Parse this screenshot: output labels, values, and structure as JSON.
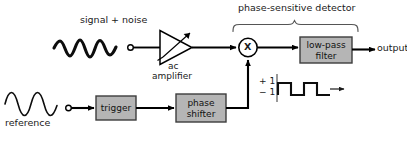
{
  "figure": {
    "type": "block-diagram",
    "background_color": "#ffffff",
    "line_color": "#000000",
    "block_fill_color": "#b5b5b5",
    "block_stroke_color": "#3d3d3d"
  },
  "labels": {
    "signal_plus_noise": "signal  +  noise",
    "ac_amplifier_line1": "ac",
    "ac_amplifier_line2": "amplifier",
    "phase_sensitive_detector": "phase-sensitive detector",
    "output": "output",
    "reference": "reference",
    "plus_one": "+ 1",
    "minus_one": "− 1",
    "mixer_symbol": "X"
  },
  "blocks": [
    {
      "id": "low-pass-filter",
      "line1": "low-pass",
      "line2": "filter",
      "x": 300,
      "y": 37,
      "w": 52,
      "h": 26
    },
    {
      "id": "trigger",
      "line1": "trigger",
      "line2": "",
      "x": 96,
      "y": 96,
      "w": 40,
      "h": 24
    },
    {
      "id": "phase-shifter",
      "line1": "phase",
      "line2": "shifter",
      "x": 176,
      "y": 94,
      "w": 50,
      "h": 28
    }
  ],
  "waveforms": {
    "signal_noise": {
      "style": "thick-noisy-sine",
      "cycles": 2.5,
      "x": 54,
      "y": 48,
      "w": 62,
      "amplitude": 10
    },
    "reference": {
      "style": "thin-sine",
      "cycles": 2.5,
      "x": 5,
      "y": 104,
      "w": 54,
      "amplitude": 11
    },
    "square_wave": {
      "style": "square",
      "cycles": 2,
      "x": 278,
      "y_high": 83,
      "y_low": 95,
      "w": 52
    }
  },
  "connections": [
    {
      "from": "signal-input-terminal",
      "to": "ac-amplifier"
    },
    {
      "from": "ac-amplifier",
      "to": "mixer"
    },
    {
      "from": "mixer",
      "to": "low-pass-filter"
    },
    {
      "from": "low-pass-filter",
      "to": "output"
    },
    {
      "from": "reference-input-terminal",
      "to": "trigger"
    },
    {
      "from": "trigger",
      "to": "phase-shifter"
    },
    {
      "from": "phase-shifter",
      "to": "mixer"
    }
  ]
}
